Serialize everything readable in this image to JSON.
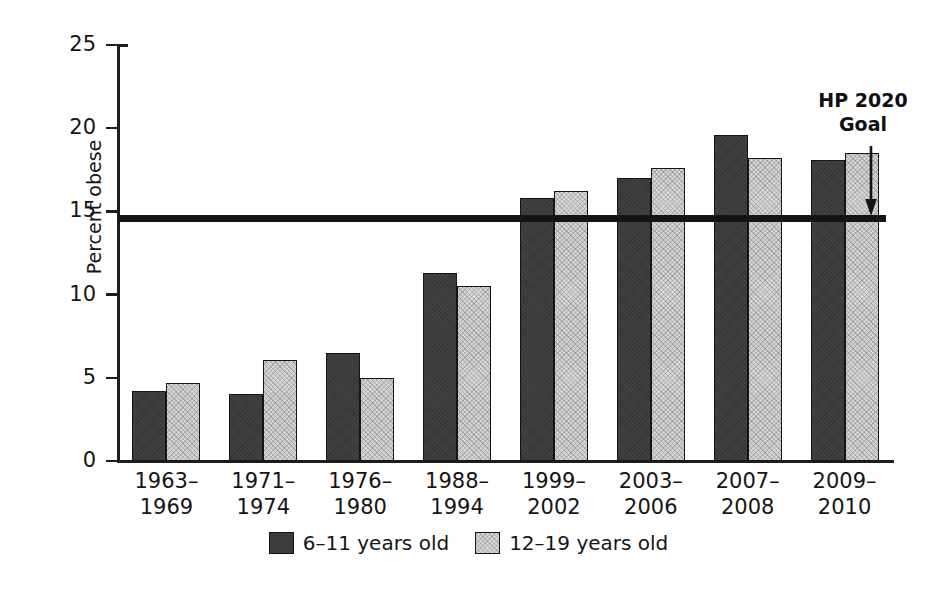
{
  "chart_data": {
    "type": "bar",
    "title": "",
    "xlabel": "",
    "ylabel": "Percent obese",
    "ylim": [
      0,
      25
    ],
    "yticks": [
      0,
      5,
      10,
      15,
      20,
      25
    ],
    "ytick_labels": [
      "0",
      "5",
      "10",
      "15",
      "20",
      "25"
    ],
    "grid": false,
    "legend_position": "bottom-center",
    "categories": [
      "1963–\n1969",
      "1971–\n1974",
      "1976–\n1980",
      "1988–\n1994",
      "1999–\n2002",
      "2003–\n2006",
      "2007–\n2008",
      "2009–\n2010"
    ],
    "category_lines": [
      [
        "1963–",
        "1969"
      ],
      [
        "1971–",
        "1974"
      ],
      [
        "1976–",
        "1980"
      ],
      [
        "1988–",
        "1994"
      ],
      [
        "1999–",
        "2002"
      ],
      [
        "2003–",
        "2006"
      ],
      [
        "2007–",
        "2008"
      ],
      [
        "2009–",
        "2010"
      ]
    ],
    "series": [
      {
        "name": "6–11 years old",
        "color": "#3c3c3c",
        "values": [
          4.2,
          4.0,
          6.5,
          11.3,
          15.8,
          17.0,
          19.6,
          18.1
        ]
      },
      {
        "name": "12–19 years old",
        "color": "#d6d6d6",
        "values": [
          4.7,
          6.1,
          5.0,
          10.5,
          16.2,
          17.6,
          18.2,
          18.5
        ]
      }
    ],
    "reference_line": {
      "label": "HP 2020 Goal",
      "label_lines": [
        "HP 2020",
        "Goal"
      ],
      "value": 14.6,
      "color": "#141414",
      "annotation_marker": "down-arrow"
    }
  },
  "legend": {
    "entries": [
      {
        "label": "6–11 years old",
        "swatch": "dark-bar-swatch"
      },
      {
        "label": "12–19 years old",
        "swatch": "light-bar-swatch"
      }
    ]
  },
  "colors": {
    "series_dark": "#3c3c3c",
    "series_light": "#d6d6d6",
    "axis": "#1d1d1d",
    "reference_line": "#141414",
    "background": "#ffffff"
  }
}
